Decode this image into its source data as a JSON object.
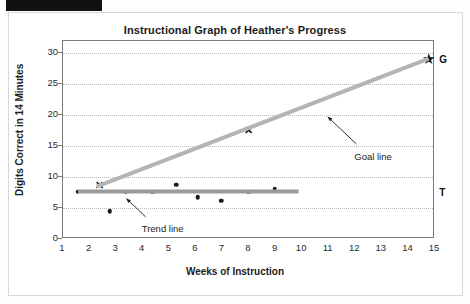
{
  "chart_data": {
    "type": "scatter",
    "title": "Instructional Graph of Heather's Progress",
    "xlabel": "Weeks of Instruction",
    "ylabel": "Digits Correct in 14 Minutes",
    "xlim": [
      1,
      15
    ],
    "ylim": [
      0,
      32
    ],
    "grid": true,
    "legend_position": "none",
    "xticks": [
      1,
      2,
      3,
      4,
      5,
      6,
      7,
      8,
      9,
      10,
      11,
      12,
      13,
      14,
      15
    ],
    "yticks": [
      0,
      5,
      10,
      15,
      20,
      25,
      30
    ],
    "series": [
      {
        "name": "Scores",
        "marker": "dot",
        "x": [
          1.6,
          2.8,
          3.4,
          4.4,
          5.3,
          6.1,
          7.0,
          8.0,
          9.0
        ],
        "y": [
          7.5,
          4.3,
          7.5,
          7.5,
          8.6,
          6.6,
          6.0,
          7.5,
          8.0
        ]
      },
      {
        "name": "Benchmark",
        "marker": "x",
        "x": [
          2.4,
          8.0
        ],
        "y": [
          8.6,
          17.5
        ]
      },
      {
        "name": "Goal",
        "marker": "star",
        "x": [
          14.8
        ],
        "y": [
          29.0
        ]
      }
    ],
    "lines": [
      {
        "name": "Goal line",
        "color": "#b4b4b4",
        "width": 4,
        "x": [
          2.3,
          14.8
        ],
        "y": [
          8.3,
          29.0
        ]
      },
      {
        "name": "Trend line",
        "color": "#9a9a9a",
        "width": 4,
        "x": [
          1.6,
          9.9
        ],
        "y": [
          7.5,
          7.5
        ]
      }
    ],
    "annotations": [
      {
        "text": "Goal line",
        "x": 12.0,
        "y": 14.0
      },
      {
        "text": "Trend line",
        "x": 4.0,
        "y": 2.4
      },
      {
        "text": "G",
        "x": 15.2,
        "y": 29.0
      },
      {
        "text": "T",
        "x": 15.2,
        "y": 7.5
      }
    ]
  },
  "axes": {
    "y_title": "Digits Correct in 14 Minutes",
    "x_title": "Weeks of Instruction",
    "y_ticks": [
      "0",
      "5",
      "10",
      "15",
      "20",
      "25",
      "30"
    ],
    "x_ticks": [
      "1",
      "2",
      "3",
      "4",
      "5",
      "6",
      "7",
      "8",
      "9",
      "10",
      "11",
      "12",
      "13",
      "14",
      "15"
    ]
  },
  "labels": {
    "title": "Instructional Graph of Heather's Progress",
    "goal_line": "Goal line",
    "trend_line": "Trend line",
    "goal_letter": "G",
    "target_letter": "T"
  }
}
